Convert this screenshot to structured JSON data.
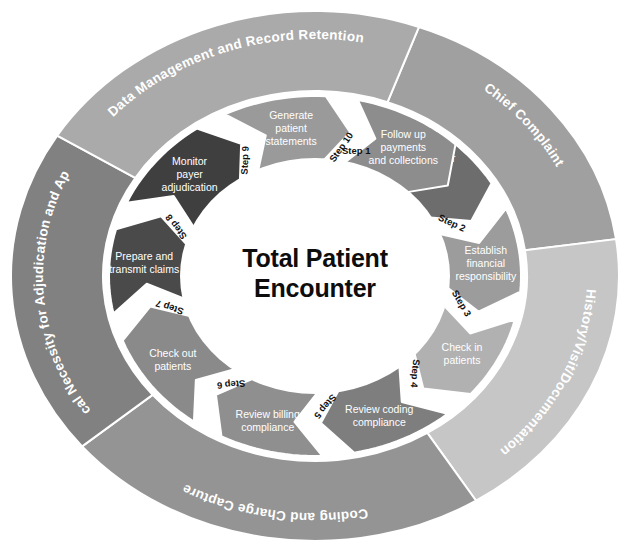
{
  "figure": {
    "center_title_line1": "Total Patient",
    "center_title_line2": "Encounter",
    "background_color": "#ffffff"
  },
  "outer_bands": [
    {
      "id": "chief-complaint",
      "label": "Chief Complaint",
      "color": "#a0a0a0",
      "start_angle": -70,
      "end_angle": -8
    },
    {
      "id": "history-visit-documentation",
      "label": "History/Visit/Documentation",
      "color": "#c6c6c6",
      "start_angle": -8,
      "end_angle": 58
    },
    {
      "id": "coding-and-charge-capture",
      "label": "Coding and Charge Capture",
      "color": "#949494",
      "start_angle": 58,
      "end_angle": 140
    },
    {
      "id": "medical-necessity",
      "label": "Medical Necessity for Adjudication and Appeals",
      "label_line1": "Medical Necessity for",
      "label_line2": "Adjudication and Appeals",
      "color": "#818181",
      "start_angle": 140,
      "end_angle": 212
    },
    {
      "id": "data-management-record-retention",
      "label": "Data Management and Record Retention",
      "color": "#aaaaaa",
      "start_angle": 212,
      "end_angle": 290
    }
  ],
  "chart_data": {
    "type": "pie",
    "title": "Total Patient Encounter",
    "legend_position": "none",
    "categories": [
      "Preregister patients",
      "Establish financial responsibility",
      "Check in patients",
      "Review coding compliance",
      "Review billing compliance",
      "Check out patients",
      "Prepare and transmit claims",
      "Monitor payer adjudication",
      "Generate patient statements",
      "Follow up payments and collections"
    ],
    "values": [
      1,
      1,
      1,
      1,
      1,
      1,
      1,
      1,
      1,
      1
    ],
    "xlabel": "",
    "ylabel": ""
  },
  "steps": [
    {
      "number": "Step 1",
      "label": "Preregister patients",
      "label_line1": "Preregister",
      "label_line2": "patients",
      "color": "#6d6d6d",
      "start_angle": -72,
      "end_angle": -22,
      "num_angle": -74,
      "num_rotate": 0
    },
    {
      "number": "Step 2",
      "label": "Establish financial responsibility",
      "label_line1": "Establish",
      "label_line2": "financial",
      "label_line3": "responsibility",
      "color": "#9c9c9c",
      "start_angle": -22,
      "end_angle": 14,
      "num_angle": -24,
      "num_rotate": 25
    },
    {
      "number": "Step 3",
      "label": "Check in patients",
      "label_line1": "Check in",
      "label_line2": "patients",
      "color": "#b1b1b1",
      "start_angle": 14,
      "end_angle": 50,
      "num_angle": 12,
      "num_rotate": 60
    },
    {
      "number": "Step 4",
      "label": "Review coding compliance",
      "label_line1": "Review coding",
      "label_line2": "compliance",
      "color": "#7e7e7e",
      "start_angle": 50,
      "end_angle": 88,
      "num_angle": 48,
      "num_rotate": 95
    },
    {
      "number": "Step 5",
      "label": "Review billing compliance",
      "label_line1": "Review billing",
      "label_line2": "compliance",
      "color": "#8f8f8f",
      "start_angle": 88,
      "end_angle": 126,
      "num_angle": 86,
      "num_rotate": 130
    },
    {
      "number": "Step 6",
      "label": "Check out patients",
      "label_line1": "Check out",
      "label_line2": "patients",
      "color": "#8a8a8a",
      "start_angle": 126,
      "end_angle": 168,
      "num_angle": 124,
      "num_rotate": 175
    },
    {
      "number": "Step 7",
      "label": "Prepare and transmit claims",
      "label_line1": "Prepare and",
      "label_line2": "transmit claims",
      "color": "#4a4a4a",
      "start_angle": 168,
      "end_angle": 204,
      "num_angle": 166,
      "num_rotate": 198
    },
    {
      "number": "Step 8",
      "label": "Monitor payer adjudication",
      "label_line1": "Monitor",
      "label_line2": "payer",
      "label_line3": "adjudication",
      "color": "#3f3f3f",
      "start_angle": 204,
      "end_angle": 244,
      "num_angle": 202,
      "num_rotate": 233
    },
    {
      "number": "Step 9",
      "label": "Generate patient statements",
      "label_line1": "Generate",
      "label_line2": "patient",
      "label_line3": "statements",
      "color": "#9a9a9a",
      "start_angle": 244,
      "end_angle": 282,
      "num_angle": 242,
      "num_rotate": 272
    },
    {
      "number": "Step 10",
      "label": "Follow up payments and collections",
      "label_line1": "Follow up",
      "label_line2": "payments",
      "label_line3": "and collections",
      "color": "#8d8d8d",
      "start_angle": 282,
      "end_angle": 322,
      "num_angle": 280,
      "num_rotate": 305
    }
  ]
}
